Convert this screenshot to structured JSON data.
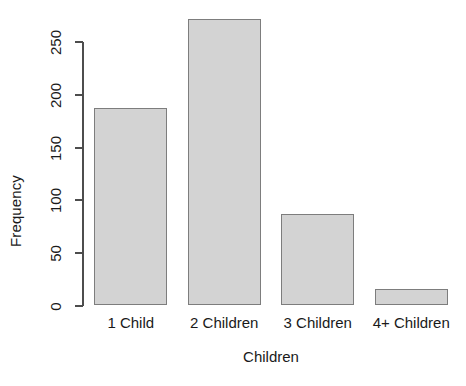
{
  "chart_data": {
    "type": "bar",
    "title": "",
    "subtitle": "",
    "xlabel": "Children",
    "ylabel": "Frequency",
    "categories": [
      "1 Child",
      "2 Children",
      "3 Children",
      "4+ Children"
    ],
    "values": [
      187,
      271,
      86,
      15
    ],
    "ylim": [
      0,
      250
    ],
    "yticks": [
      0,
      50,
      100,
      150,
      200,
      250
    ],
    "ytick_labels": [
      "0",
      "50",
      "100",
      "150",
      "200",
      "250"
    ],
    "grid": false,
    "legend": null,
    "legend_position": "none",
    "annotations": [],
    "style": {
      "bar_fill": "#d3d3d3",
      "bar_border": "#7d7d7d",
      "axis_color": "#4d4d4d",
      "text_color": "#1a1a1a",
      "background": "#ffffff"
    }
  }
}
